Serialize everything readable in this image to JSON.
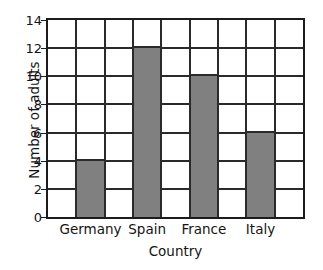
{
  "chart_data": {
    "type": "bar",
    "title": "",
    "title_visible": false,
    "categories": [
      "Germany",
      "Spain",
      "France",
      "Italy"
    ],
    "values": [
      4,
      12,
      10,
      6
    ],
    "series": [
      {
        "name": "Number of adults",
        "values": [
          4,
          12,
          10,
          6
        ]
      }
    ],
    "xlabel": "Country",
    "ylabel": "Number of adults",
    "ylim": [
      0,
      14
    ],
    "ytick_labels": [
      "0",
      "2",
      "4",
      "6",
      "8",
      "10",
      "12",
      "14"
    ],
    "ytick_values": [
      0,
      2,
      4,
      6,
      8,
      10,
      12,
      14
    ],
    "ytick_step": 2,
    "grid": true,
    "grid_columns": 9,
    "grid_rows": 7,
    "legend": null,
    "bar_color": "#808080",
    "bar_edge_color": "#2a2a2a",
    "axis_color": "#1c1c1c",
    "grid_color": "#2a2a2a",
    "background_color": "#ffffff",
    "bar_column_indices": [
      2,
      4,
      6,
      8
    ]
  }
}
